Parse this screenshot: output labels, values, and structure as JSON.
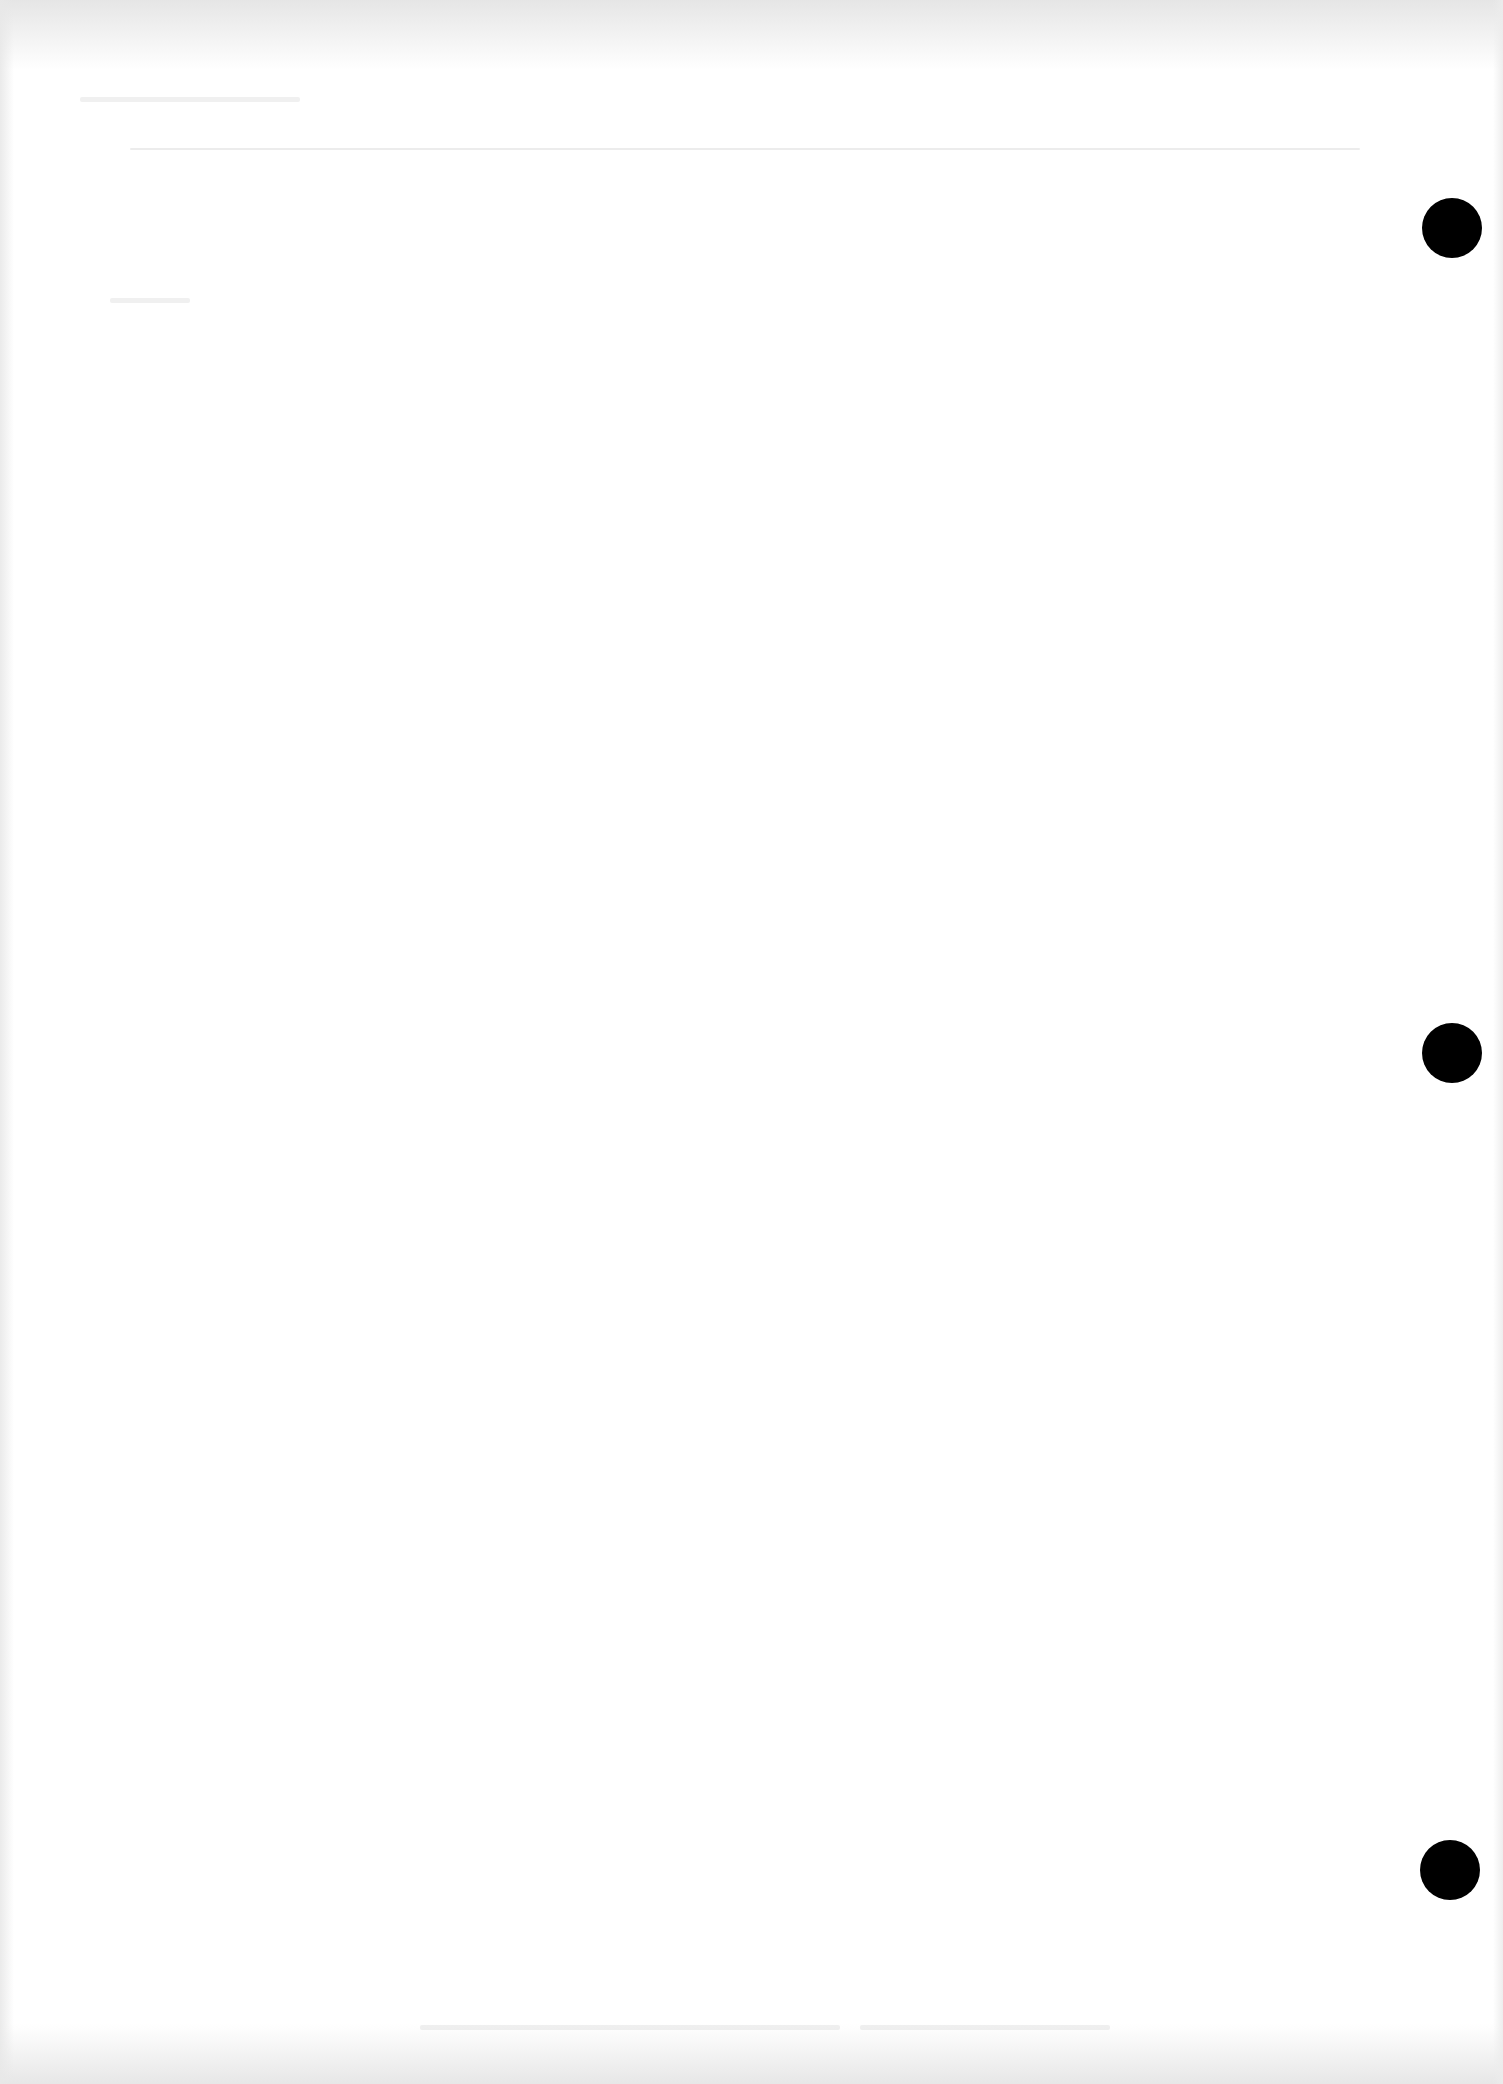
{
  "document": {
    "type": "blank scanned page",
    "background_color": "#ffffff",
    "hole_color": "#000000",
    "punch_holes": [
      {
        "id": "top",
        "cx": 1452,
        "cy": 228,
        "diameter": 60
      },
      {
        "id": "middle",
        "cx": 1452,
        "cy": 1053,
        "diameter": 60
      },
      {
        "id": "bottom",
        "cx": 1450,
        "cy": 1870,
        "diameter": 60
      }
    ]
  }
}
